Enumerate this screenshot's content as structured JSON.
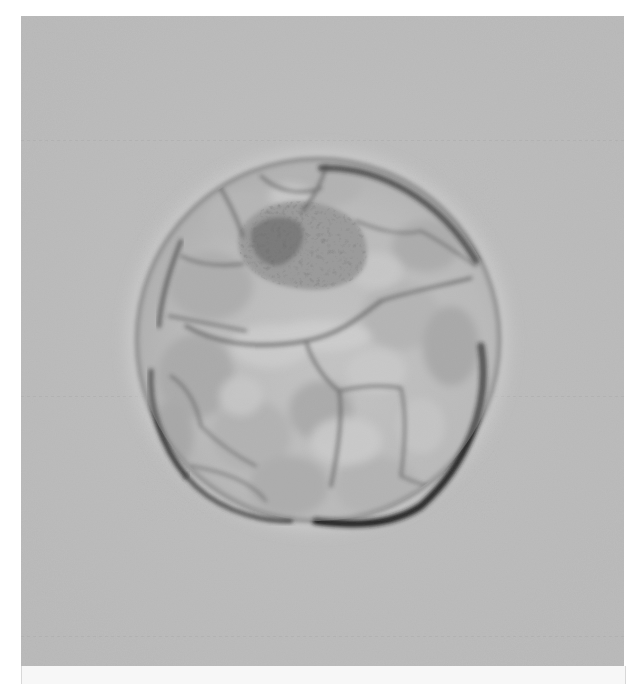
{
  "image": {
    "subject": "blastocyst-embryo-microscopy",
    "style": "grayscale brightfield/Hoffman modulation contrast",
    "colors": {
      "background": "#bdbdbd",
      "background_light": "#c6c6c6",
      "cell_fill": "#b8b8b8",
      "cell_highlight": "#d4d4d4",
      "membrane_dark": "#2a2a2a",
      "inner_cell_mass": "#4a4a4a",
      "frame_border": "#ffffff"
    },
    "cell": {
      "center_x": 297,
      "center_y": 324,
      "radius": 183
    }
  }
}
